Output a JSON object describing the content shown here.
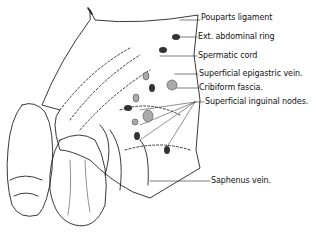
{
  "figure": {
    "labels": [
      {
        "id": "pouparts-ligament",
        "text": "Pouparts ligament",
        "x": 201,
        "y": 19
      },
      {
        "id": "ext-abdominal-ring",
        "text": "Ext. abdominal ring",
        "x": 198,
        "y": 38
      },
      {
        "id": "spermatic-cord",
        "text": "Spermatic cord",
        "x": 198,
        "y": 57
      },
      {
        "id": "superficial-epigastric-vein",
        "text": "Superficial epigastric vein.",
        "x": 199,
        "y": 75
      },
      {
        "id": "cribriform-fascia",
        "text": "Cribiform fascia.",
        "x": 199,
        "y": 89
      },
      {
        "id": "superficial-inguinal-nodes",
        "text": "Superficial inguinal nodes.",
        "x": 205,
        "y": 103
      },
      {
        "id": "saphenus-vein",
        "text": "Saphenus vein.",
        "x": 211,
        "y": 182
      }
    ]
  }
}
